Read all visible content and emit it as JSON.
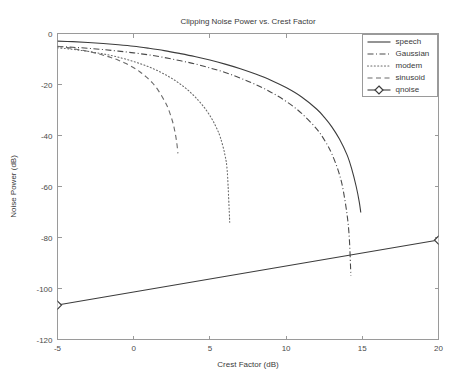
{
  "figure": {
    "title": "Clipping Noise Power vs. Crest Factor",
    "background_color": "#ffffff",
    "axis_color": "#9a9a9a",
    "text_color": "#3a3a3a"
  },
  "chart_data": {
    "type": "line",
    "title": "Clipping Noise Power vs. Crest Factor",
    "xlabel": "Crest Factor (dB)",
    "ylabel": "Noise Power (dB)",
    "xlim": [
      -5,
      20
    ],
    "ylim": [
      -120,
      0
    ],
    "xticks": [
      -5,
      0,
      5,
      10,
      15,
      20
    ],
    "xticklabels": [
      "-5",
      "0",
      "5",
      "10",
      "15",
      "20"
    ],
    "yticks": [
      0,
      -20,
      -40,
      -60,
      -80,
      -100,
      -120
    ],
    "yticklabels": [
      "0",
      "-20",
      "-40",
      "-60",
      "-80",
      "-100",
      "-120"
    ],
    "grid": false,
    "legend_position": "upper right",
    "series": [
      {
        "name": "speech",
        "linestyle": "solid",
        "color": "#3c3c3c",
        "marker": "none",
        "x": [
          -5.0,
          -4.0,
          -3.0,
          -2.0,
          -1.0,
          0.0,
          1.0,
          2.0,
          3.0,
          4.0,
          5.0,
          6.0,
          7.0,
          8.0,
          9.0,
          10.0,
          11.0,
          12.0,
          12.5,
          13.0,
          13.5,
          14.0,
          14.3,
          14.6,
          14.8,
          14.9
        ],
        "y": [
          -3.0,
          -3.2,
          -3.5,
          -3.9,
          -4.4,
          -5.0,
          -5.8,
          -6.7,
          -7.8,
          -9.0,
          -10.4,
          -12.0,
          -13.8,
          -15.9,
          -18.3,
          -21.2,
          -24.8,
          -29.6,
          -32.8,
          -36.6,
          -41.4,
          -47.6,
          -53.0,
          -60.0,
          -66.0,
          -70.2
        ]
      },
      {
        "name": "Gaussian",
        "linestyle": "dashdot",
        "color": "#4a4a4a",
        "marker": "none",
        "x": [
          -5.0,
          -4.0,
          -3.0,
          -2.0,
          -1.0,
          0.0,
          1.0,
          2.0,
          3.0,
          4.0,
          5.0,
          6.0,
          7.0,
          8.0,
          9.0,
          10.0,
          11.0,
          12.0,
          12.6,
          13.0,
          13.4,
          13.7,
          14.0,
          14.15,
          14.25
        ],
        "y": [
          -5.1,
          -5.4,
          -5.8,
          -6.3,
          -6.9,
          -7.6,
          -8.4,
          -9.4,
          -10.6,
          -11.9,
          -13.5,
          -15.3,
          -17.5,
          -20.0,
          -23.0,
          -26.6,
          -31.2,
          -37.4,
          -42.6,
          -47.2,
          -53.4,
          -60.0,
          -71.0,
          -80.5,
          -95.0
        ]
      },
      {
        "name": "modem",
        "linestyle": "dotted",
        "color": "#6a6a6a",
        "marker": "none",
        "x": [
          -5.0,
          -4.5,
          -4.0,
          -3.5,
          -3.0,
          -2.5,
          -2.0,
          -1.5,
          -1.0,
          -0.5,
          0.0,
          0.5,
          1.0,
          1.5,
          2.0,
          2.5,
          3.0,
          3.5,
          4.0,
          4.5,
          5.0,
          5.4,
          5.7,
          6.0,
          6.15,
          6.3
        ],
        "y": [
          -5.6,
          -5.9,
          -6.2,
          -6.6,
          -7.0,
          -7.5,
          -8.0,
          -8.6,
          -9.3,
          -10.1,
          -11.0,
          -12.0,
          -13.1,
          -14.4,
          -15.9,
          -17.6,
          -19.6,
          -21.9,
          -24.7,
          -28.0,
          -32.2,
          -36.6,
          -41.0,
          -48.0,
          -55.0,
          -74.0
        ]
      },
      {
        "name": "sinusoid",
        "linestyle": "dashed",
        "color": "#6a6a6a",
        "marker": "none",
        "x": [
          -5.0,
          -4.5,
          -4.0,
          -3.5,
          -3.0,
          -2.5,
          -2.0,
          -1.5,
          -1.0,
          -0.5,
          0.0,
          0.4,
          0.8,
          1.2,
          1.6,
          2.0,
          2.25,
          2.45,
          2.6,
          2.7,
          2.78,
          2.85,
          2.9
        ],
        "y": [
          -5.0,
          -5.4,
          -5.9,
          -6.4,
          -7.0,
          -7.7,
          -8.5,
          -9.4,
          -10.5,
          -11.8,
          -13.4,
          -15.0,
          -16.9,
          -19.2,
          -22.2,
          -26.2,
          -29.2,
          -32.6,
          -35.6,
          -38.4,
          -41.0,
          -44.0,
          -47.0
        ]
      },
      {
        "name": "qnoise",
        "linestyle": "solid",
        "color": "#3c3c3c",
        "marker": "diamond",
        "x": [
          -5.0,
          20.0
        ],
        "y": [
          -106.5,
          -81.0
        ]
      }
    ]
  },
  "legend": {
    "entries": [
      {
        "label": "speech",
        "style": "solid",
        "marker": "none"
      },
      {
        "label": "Gaussian",
        "style": "dashdot",
        "marker": "none"
      },
      {
        "label": "modem",
        "style": "dotted",
        "marker": "none"
      },
      {
        "label": "sinusoid",
        "style": "dashed",
        "marker": "none"
      },
      {
        "label": "qnoise",
        "style": "solid",
        "marker": "diamond"
      }
    ]
  }
}
